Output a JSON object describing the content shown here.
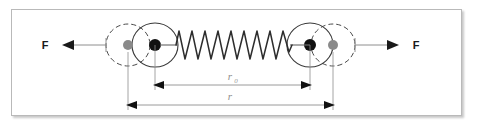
{
  "figure": {
    "background_color": "#ffffff",
    "frame": {
      "border_color": "#b9b9b9",
      "shadow_color": "#787878"
    },
    "colors": {
      "outline": "#3a3a3a",
      "dashed_outline": "#4a4a4a",
      "nucleus_solid": "#111111",
      "nucleus_ghost": "#8a8a8a",
      "spring": "#2d2d2d",
      "dimension_line": "#8e8e8e",
      "force_line": "#8e8e8e",
      "force_arrow": "#1a1a1a",
      "label_text": "#1a1a1a",
      "dimension_text": "#8e8e8e"
    },
    "force_labels": {
      "left": "F",
      "right": "F"
    },
    "dimensions": [
      {
        "id": "r-zero",
        "label": "r",
        "subscript": "0",
        "description": "equilibrium separation between displaced nuclei",
        "from_x": 155,
        "to_x": 310,
        "y": 85
      },
      {
        "id": "r-total",
        "label": "r",
        "subscript": "",
        "description": "stretched separation between original nucleus positions",
        "from_x": 128,
        "to_x": 333,
        "y": 105
      }
    ],
    "atoms": [
      {
        "id": "left-atom",
        "side": "left",
        "ghost_circle": {
          "cx": 128,
          "cy": 45,
          "r": 22,
          "style": "dashed"
        },
        "solid_circle": {
          "cx": 155,
          "cy": 45,
          "r": 23,
          "style": "solid"
        },
        "ghost_nucleus": {
          "cx": 128,
          "cy": 45,
          "r": 5,
          "fill": "#8a8a8a"
        },
        "solid_nucleus": {
          "cx": 155,
          "cy": 45,
          "r": 6,
          "fill": "#111111"
        }
      },
      {
        "id": "right-atom",
        "side": "right",
        "ghost_circle": {
          "cx": 333,
          "cy": 45,
          "r": 22,
          "style": "dashed"
        },
        "solid_circle": {
          "cx": 310,
          "cy": 45,
          "r": 23,
          "style": "solid"
        },
        "ghost_nucleus": {
          "cx": 333,
          "cy": 45,
          "r": 5,
          "fill": "#8a8a8a"
        },
        "solid_nucleus": {
          "cx": 310,
          "cy": 45,
          "r": 6,
          "fill": "#111111"
        }
      }
    ],
    "spring": {
      "start_x": 176,
      "end_x": 292,
      "center_y": 45,
      "amplitude": 15,
      "coils": 9
    },
    "icon_names": {
      "force_arrow_left": "arrow-left-icon",
      "force_arrow_right": "arrow-right-icon",
      "spring": "spring-coil-icon",
      "atom": "atom-circle-icon",
      "nucleus": "nucleus-dot-icon"
    }
  }
}
